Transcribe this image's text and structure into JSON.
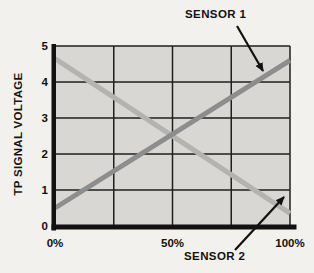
{
  "chart_data": {
    "type": "line",
    "title": "",
    "xlabel": "",
    "ylabel": "TP SIGNAL VOLTAGE",
    "xlim": [
      0,
      100
    ],
    "ylim": [
      0,
      5
    ],
    "grid": {
      "x_values": [
        25,
        50,
        75,
        100
      ],
      "y_values": [
        1,
        2,
        3,
        4,
        5
      ]
    },
    "xticks": [
      {
        "value": 0,
        "label": "0%"
      },
      {
        "value": 50,
        "label": "50%"
      },
      {
        "value": 100,
        "label": "100%"
      }
    ],
    "yticks": [
      {
        "value": 0,
        "label": "0"
      },
      {
        "value": 1,
        "label": "1"
      },
      {
        "value": 2,
        "label": "2"
      },
      {
        "value": 3,
        "label": "3"
      },
      {
        "value": 4,
        "label": "4"
      },
      {
        "value": 5,
        "label": "5"
      }
    ],
    "series": [
      {
        "name": "SENSOR 1",
        "x": [
          0,
          100
        ],
        "values": [
          0.5,
          4.6
        ],
        "color": "#8d8d8d"
      },
      {
        "name": "SENSOR 2",
        "x": [
          0,
          100
        ],
        "values": [
          4.65,
          0.35
        ],
        "color": "#b3b3b0"
      }
    ],
    "crossing_point": {
      "x": 50,
      "value": 2.55
    },
    "annotations": [
      {
        "label": "SENSOR 1",
        "arrow_from_px": {
          "x": 237,
          "y": 26
        },
        "arrow_to_px": {
          "x": 263,
          "y": 71
        }
      },
      {
        "label": "SENSOR 2",
        "arrow_from_px": {
          "x": 235,
          "y": 250
        },
        "arrow_to_px": {
          "x": 284,
          "y": 197
        }
      }
    ],
    "colors": {
      "page_bg": "#f2f1ed",
      "plot_bg": "#d8d7d3",
      "grid": "#1f1f1f",
      "axis": "#111111",
      "text": "#111111"
    },
    "legend_position": "annotated-arrows",
    "grid_on": true
  }
}
